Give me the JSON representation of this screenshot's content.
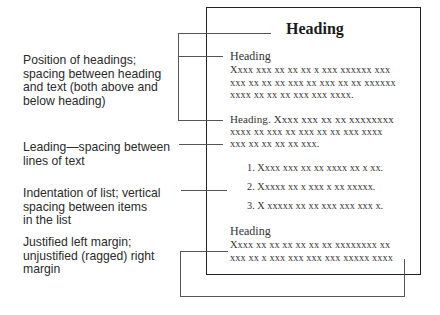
{
  "labels": [
    {
      "lines": [
        "Position of headings;",
        "spacing between heading",
        "and text (both above and",
        "below heading)"
      ]
    },
    {
      "lines": [
        "Leading—spacing between",
        "lines of text"
      ]
    },
    {
      "lines": [
        "Indentation of list; vertical",
        "spacing between items",
        "in the list"
      ]
    },
    {
      "lines": [
        "Justified left margin;",
        "unjustified (ragged) right",
        "margin"
      ]
    }
  ],
  "page": {
    "title": "Heading",
    "section1": {
      "heading": "Heading",
      "lines": [
        "Xxxx xxx xx xx xx x xxx xxxxxx xxx",
        "xxx xx xx xx xxx xx xxx xx xx xxxxxx",
        "xxxx xx xx xx xxx xxx xxxx."
      ]
    },
    "section2": {
      "lines": [
        "Heading.  Xxxx xxx xx xx xxxxxxxx",
        "xxxx xx xxx xx xxx xx xx xxx xxxx",
        "xxx xx xx xx xx xxx."
      ]
    },
    "list": [
      "1. Xxxx xxx xx xx xxxx xx x xx.",
      "2. Xxxxx xx x xxx x xx xxxxx.",
      "3. X xxxxx xx xx xxx xxx xxx x."
    ],
    "section3": {
      "heading": "Heading",
      "lines": [
        "Xxxx xx xx xx xx xx xx xxxxxxxx xx",
        "xxx xx x xxx xxx xxx xxx xxxxx xxxx"
      ]
    }
  }
}
